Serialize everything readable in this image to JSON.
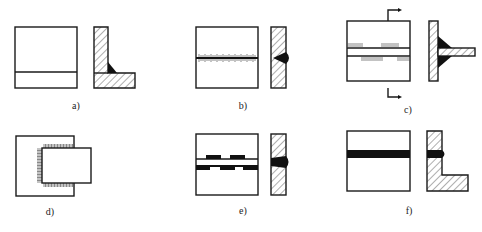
{
  "figure": {
    "panels": [
      {
        "id": "a",
        "label": "a)",
        "joint": "corner joint with fillet weld"
      },
      {
        "id": "b",
        "label": "b)",
        "joint": "butt joint, intermittent seam"
      },
      {
        "id": "c",
        "label": "c)",
        "joint": "T-joint with staggered intermittent fillet welds, section arrows"
      },
      {
        "id": "d",
        "label": "d)",
        "joint": "lap joint, weld around perimeter"
      },
      {
        "id": "e",
        "label": "e)",
        "joint": "butt joint with staggered weld segments"
      },
      {
        "id": "f",
        "label": "f)",
        "joint": "corner/butt joint, continuous weld"
      }
    ]
  },
  "colors": {
    "line": "#1a1a1a",
    "weld_fill": "#111111",
    "background": "#ffffff"
  }
}
